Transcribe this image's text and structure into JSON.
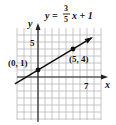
{
  "chart_data": {
    "type": "line",
    "equation": {
      "lhs": "y =",
      "numerator": "3",
      "denominator": "5",
      "rhs": "x + 1"
    },
    "xlabel": "x",
    "ylabel": "y",
    "xlim": [
      -3,
      9
    ],
    "ylim": [
      -6,
      7
    ],
    "grid": true,
    "tick_labels": {
      "x": [
        {
          "value": 7,
          "label": "7"
        }
      ],
      "y": [
        {
          "value": 5,
          "label": "5"
        }
      ]
    },
    "series": [
      {
        "name": "y = 3/5 x + 1",
        "slope": 0.6,
        "intercept": 1,
        "x": [
          -3,
          9
        ],
        "y": [
          -0.8,
          6.4
        ]
      }
    ],
    "points": [
      {
        "x": 0,
        "y": 1,
        "label": "(0, 1)"
      },
      {
        "x": 5,
        "y": 4,
        "label": "(5, 4)"
      }
    ],
    "colors": {
      "grid": "#b8b8b8",
      "axis": "#222222",
      "line": "#111111"
    }
  }
}
